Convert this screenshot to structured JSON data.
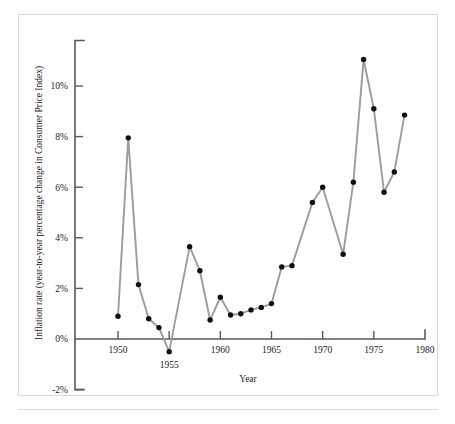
{
  "figure": {
    "y_axis_title": "Inflation rate (year-to-year percentage change in Consumer Price Index)",
    "x_axis_title": "Year",
    "line_color": "#9c9c9c",
    "marker_color": "#101010",
    "axis_color": "#59595a",
    "background_color": "#ffffff"
  },
  "chart_data": {
    "type": "line",
    "title": "",
    "subtitle": "",
    "xlabel": "Year",
    "ylabel": "Inflation rate (year-to-year percentage change in Consumer Price Index)",
    "xlim": [
      1948.5,
      1980.5
    ],
    "ylim": [
      -2,
      11.8
    ],
    "xticks": [
      1950,
      1955,
      1960,
      1965,
      1970,
      1975,
      1980
    ],
    "xtick_labels": [
      "1950",
      "1955",
      "1960",
      "1965",
      "1970",
      "1975",
      "1980"
    ],
    "yticks": [
      -2,
      0,
      2,
      4,
      6,
      8,
      10
    ],
    "ytick_labels": [
      "-2%",
      "0%",
      "2%",
      "4%",
      "6%",
      "8%",
      "10%"
    ],
    "grid": false,
    "legend": false,
    "markers": "filled-circle",
    "x": [
      1950,
      1951,
      1952,
      1953,
      1954,
      1955,
      1957,
      1958,
      1959,
      1960,
      1961,
      1962,
      1963,
      1964,
      1965,
      1966,
      1967,
      1969,
      1970,
      1972,
      1973,
      1974,
      1975,
      1976,
      1977,
      1978
    ],
    "values": [
      0.9,
      7.95,
      2.15,
      0.8,
      0.45,
      -0.5,
      3.65,
      2.7,
      0.75,
      1.65,
      0.95,
      1.0,
      1.15,
      1.25,
      1.4,
      2.85,
      2.9,
      5.4,
      6.0,
      3.35,
      6.2,
      11.05,
      9.1,
      5.8,
      6.6,
      8.85
    ],
    "points": [
      {
        "year": 1950,
        "rate": 0.9
      },
      {
        "year": 1951,
        "rate": 7.95
      },
      {
        "year": 1952,
        "rate": 2.15
      },
      {
        "year": 1953,
        "rate": 0.8
      },
      {
        "year": 1954,
        "rate": 0.45
      },
      {
        "year": 1955,
        "rate": -0.5
      },
      {
        "year": 1957,
        "rate": 3.65
      },
      {
        "year": 1958,
        "rate": 2.7
      },
      {
        "year": 1959,
        "rate": 0.75
      },
      {
        "year": 1960,
        "rate": 1.65
      },
      {
        "year": 1961,
        "rate": 0.95
      },
      {
        "year": 1962,
        "rate": 1.0
      },
      {
        "year": 1963,
        "rate": 1.15
      },
      {
        "year": 1964,
        "rate": 1.25
      },
      {
        "year": 1965,
        "rate": 1.4
      },
      {
        "year": 1966,
        "rate": 2.85
      },
      {
        "year": 1967,
        "rate": 2.9
      },
      {
        "year": 1969,
        "rate": 5.4
      },
      {
        "year": 1970,
        "rate": 6.0
      },
      {
        "year": 1972,
        "rate": 3.35
      },
      {
        "year": 1973,
        "rate": 6.2
      },
      {
        "year": 1974,
        "rate": 11.05
      },
      {
        "year": 1975,
        "rate": 9.1
      },
      {
        "year": 1976,
        "rate": 5.8
      },
      {
        "year": 1977,
        "rate": 6.6
      },
      {
        "year": 1978,
        "rate": 8.85
      }
    ]
  }
}
